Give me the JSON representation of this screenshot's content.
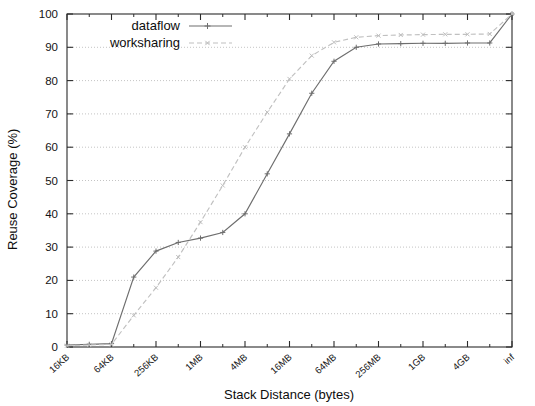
{
  "chart_data": {
    "type": "line",
    "title": "",
    "xlabel": "Stack Distance (bytes)",
    "ylabel": "Reuse Coverage (%)",
    "ylim": [
      0,
      100
    ],
    "yticks": [
      0,
      10,
      20,
      30,
      40,
      50,
      60,
      70,
      80,
      90,
      100
    ],
    "ytick_labels": [
      "0",
      "10",
      "20",
      "30",
      "40",
      "50",
      "60",
      "70",
      "80",
      "90",
      "100"
    ],
    "xtick_labels": [
      "16KB",
      "64KB",
      "256KB",
      "1MB",
      "4MB",
      "16MB",
      "64MB",
      "256MB",
      "1GB",
      "4GB",
      "inf"
    ],
    "grid": true,
    "legend_position": "top-left",
    "x_index_range": [
      0,
      20
    ],
    "series": [
      {
        "name": "dataflow",
        "marker": "plus",
        "linestyle": "solid",
        "color": "#6e6e6e",
        "x_indices": [
          0,
          1,
          2,
          3,
          4,
          5,
          6,
          7,
          8,
          9,
          10,
          11,
          12,
          13,
          14,
          15,
          16,
          17,
          18,
          19,
          20
        ],
        "values": [
          0.6,
          0.8,
          1.0,
          21.0,
          28.8,
          31.4,
          32.7,
          34.4,
          40.0,
          52.0,
          64.0,
          76.2,
          85.8,
          90.0,
          91.0,
          91.1,
          91.2,
          91.2,
          91.3,
          91.3,
          100.0
        ]
      },
      {
        "name": "worksharing",
        "marker": "cross",
        "linestyle": "dashed",
        "color": "#c0c0c0",
        "x_indices": [
          0,
          1,
          2,
          3,
          4,
          5,
          6,
          7,
          8,
          9,
          10,
          11,
          12,
          13,
          14,
          15,
          16,
          17,
          18,
          19,
          20
        ],
        "values": [
          0.4,
          0.6,
          0.8,
          9.5,
          17.8,
          27.0,
          37.5,
          48.5,
          60.0,
          70.5,
          80.5,
          87.5,
          91.5,
          93.0,
          93.5,
          93.7,
          93.8,
          93.9,
          93.9,
          94.0,
          100.0
        ]
      }
    ]
  },
  "legend": {
    "entries": [
      {
        "label": "dataflow"
      },
      {
        "label": "worksharing"
      }
    ]
  },
  "axes": {
    "y_title": "Reuse Coverage (%)",
    "x_title": "Stack Distance (bytes)"
  }
}
